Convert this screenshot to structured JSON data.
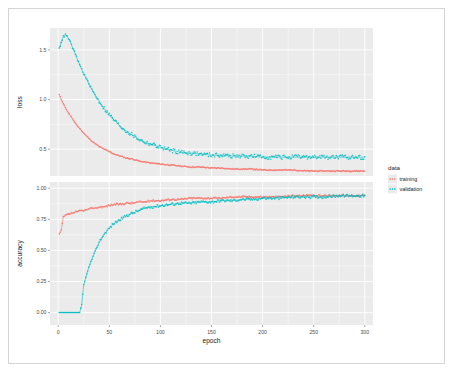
{
  "figure": {
    "background_color": "#ffffff",
    "frame_color": "#d4d4d4",
    "panel_color": "#ebebeb",
    "grid_color": "#ffffff"
  },
  "legend": {
    "title": "data",
    "position": "right",
    "items": [
      {
        "label": "training",
        "color": "#f8766d",
        "key_icon": "point-key-icon"
      },
      {
        "label": "validation",
        "color": "#00bfc4",
        "key_icon": "point-key-icon"
      }
    ]
  },
  "axes": {
    "x_title": "epoch",
    "x_ticks": [
      "0",
      "50",
      "100",
      "150",
      "200",
      "250",
      "300"
    ],
    "panels": [
      {
        "y_title": "loss",
        "y_ticks": [
          "0.5",
          "1.0",
          "1.5"
        ]
      },
      {
        "y_title": "accuracy",
        "y_ticks": [
          "0.00",
          "0.25",
          "0.50",
          "0.75",
          "1.00"
        ]
      }
    ]
  },
  "chart_data": {
    "type": "scatter",
    "title": "",
    "subtitle": "",
    "xlabel": "epoch",
    "ylabel": "",
    "facets": [
      {
        "name": "loss",
        "ylabel": "loss",
        "ylim": [
          0.23,
          1.72
        ],
        "xlim": [
          -8,
          308
        ],
        "grid": true,
        "yticks": [
          0.5,
          1.0,
          1.5
        ],
        "series": [
          {
            "name": "training",
            "color": "#f8766d",
            "style": "points+smooth",
            "x": [
              1,
              3,
              5,
              7,
              9,
              11,
              13,
              15,
              17,
              19,
              21,
              25,
              29,
              33,
              37,
              41,
              45,
              49,
              55,
              61,
              67,
              73,
              79,
              85,
              91,
              100,
              110,
              120,
              130,
              140,
              150,
              160,
              170,
              180,
              190,
              200,
              215,
              230,
              245,
              260,
              275,
              290,
              300
            ],
            "y": [
              1.05,
              1.0,
              0.96,
              0.92,
              0.88,
              0.85,
              0.82,
              0.79,
              0.76,
              0.73,
              0.71,
              0.66,
              0.62,
              0.58,
              0.55,
              0.52,
              0.5,
              0.48,
              0.45,
              0.43,
              0.41,
              0.4,
              0.38,
              0.37,
              0.36,
              0.35,
              0.34,
              0.33,
              0.32,
              0.32,
              0.31,
              0.31,
              0.3,
              0.3,
              0.3,
              0.29,
              0.29,
              0.29,
              0.28,
              0.28,
              0.28,
              0.28,
              0.28
            ]
          },
          {
            "name": "validation",
            "color": "#00bfc4",
            "style": "points+smooth",
            "x": [
              1,
              3,
              5,
              7,
              9,
              11,
              13,
              15,
              17,
              19,
              21,
              25,
              29,
              33,
              37,
              41,
              45,
              49,
              55,
              61,
              67,
              73,
              79,
              85,
              91,
              100,
              110,
              120,
              130,
              140,
              150,
              160,
              170,
              180,
              190,
              200,
              215,
              230,
              245,
              260,
              275,
              290,
              300
            ],
            "y": [
              1.51,
              1.58,
              1.63,
              1.65,
              1.63,
              1.6,
              1.55,
              1.5,
              1.45,
              1.4,
              1.35,
              1.26,
              1.18,
              1.1,
              1.03,
              0.97,
              0.91,
              0.86,
              0.79,
              0.73,
              0.68,
              0.64,
              0.6,
              0.57,
              0.55,
              0.52,
              0.49,
              0.47,
              0.46,
              0.45,
              0.44,
              0.44,
              0.43,
              0.43,
              0.43,
              0.42,
              0.42,
              0.42,
              0.42,
              0.42,
              0.42,
              0.42,
              0.42
            ]
          }
        ]
      },
      {
        "name": "accuracy",
        "ylabel": "accuracy",
        "ylim": [
          -0.1,
          1.05
        ],
        "xlim": [
          -8,
          308
        ],
        "grid": true,
        "yticks": [
          0.0,
          0.25,
          0.5,
          0.75,
          1.0
        ],
        "series": [
          {
            "name": "training",
            "color": "#f8766d",
            "style": "points+smooth",
            "x": [
              1,
              3,
              5,
              7,
              9,
              11,
              13,
              15,
              17,
              19,
              21,
              25,
              29,
              33,
              37,
              41,
              45,
              49,
              55,
              61,
              67,
              73,
              79,
              85,
              91,
              100,
              110,
              120,
              130,
              140,
              150,
              160,
              170,
              180,
              190,
              200,
              215,
              230,
              245,
              260,
              275,
              290,
              300
            ],
            "y": [
              0.63,
              0.66,
              0.77,
              0.78,
              0.79,
              0.79,
              0.8,
              0.8,
              0.81,
              0.81,
              0.82,
              0.82,
              0.83,
              0.84,
              0.84,
              0.85,
              0.85,
              0.86,
              0.87,
              0.87,
              0.88,
              0.88,
              0.89,
              0.89,
              0.9,
              0.9,
              0.91,
              0.91,
              0.92,
              0.92,
              0.92,
              0.92,
              0.93,
              0.93,
              0.93,
              0.93,
              0.93,
              0.94,
              0.94,
              0.94,
              0.94,
              0.94,
              0.94
            ]
          },
          {
            "name": "validation",
            "color": "#00bfc4",
            "style": "points+smooth",
            "x": [
              1,
              3,
              5,
              7,
              9,
              11,
              13,
              15,
              17,
              19,
              21,
              23,
              25,
              29,
              33,
              37,
              41,
              45,
              49,
              55,
              61,
              67,
              73,
              79,
              85,
              91,
              100,
              110,
              120,
              130,
              140,
              150,
              160,
              170,
              180,
              190,
              200,
              215,
              230,
              245,
              260,
              275,
              290,
              300
            ],
            "y": [
              0.0,
              0.0,
              0.0,
              0.0,
              0.0,
              0.0,
              0.0,
              0.0,
              0.0,
              0.0,
              0.0,
              0.06,
              0.22,
              0.34,
              0.43,
              0.51,
              0.58,
              0.63,
              0.67,
              0.72,
              0.75,
              0.78,
              0.8,
              0.82,
              0.84,
              0.85,
              0.86,
              0.87,
              0.88,
              0.88,
              0.89,
              0.89,
              0.9,
              0.9,
              0.91,
              0.91,
              0.92,
              0.92,
              0.93,
              0.93,
              0.93,
              0.94,
              0.94,
              0.94
            ]
          }
        ]
      }
    ]
  }
}
